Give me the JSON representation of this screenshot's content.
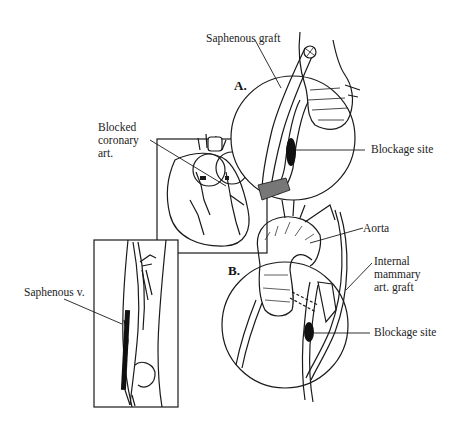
{
  "figure": {
    "type": "medical-illustration",
    "panels": [
      {
        "id": "A",
        "letter": "A.",
        "description": "Saphenous vein graft bypassing blockage"
      },
      {
        "id": "B",
        "letter": "B.",
        "description": "Internal mammary artery graft bypassing blockage"
      }
    ],
    "labels": {
      "saphenous_graft": "Saphenous graft",
      "blocked_coronary_line1": "Blocked",
      "blocked_coronary_line2": "coronary",
      "blocked_coronary_line3": "art.",
      "blockage_site_a": "Blockage site",
      "aorta": "Aorta",
      "internal_mammary_line1": "Internal",
      "internal_mammary_line2": "mammary",
      "internal_mammary_line3": "art. graft",
      "blockage_site_b": "Blockage site",
      "saphenous_vein": "Saphenous v."
    },
    "colors": {
      "ink": "#1a1a1a",
      "background": "#ffffff"
    }
  }
}
